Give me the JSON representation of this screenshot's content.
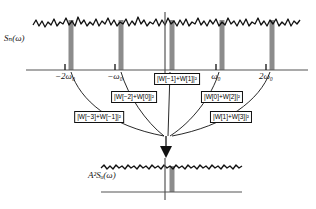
{
  "figure": {
    "width": 316,
    "height": 209,
    "colors": {
      "line": "#111111",
      "bar": "#8c8c8c",
      "axis": "#555555",
      "background": "#ffffff"
    }
  },
  "top_plot": {
    "y_axis_label": "Sₙ(ω)",
    "tick_labels": [
      {
        "text": "−2ω₀",
        "x": 65
      },
      {
        "text": "−ω₀",
        "x": 115
      },
      {
        "text": "ω₀",
        "x": 216
      },
      {
        "text": "2ω₀",
        "x": 266
      }
    ],
    "tick_positions_px": [
      65,
      115,
      165,
      216,
      266
    ],
    "bar_positions_px": [
      71,
      121,
      172,
      222,
      272
    ],
    "bar_count": 5,
    "noise_floor_description": "broadband jagged noise spectrum"
  },
  "annotations": [
    {
      "id": "w-m1-p1",
      "text": "|W[−1]+W[1]|²",
      "x": 177,
      "y": 73
    },
    {
      "id": "w-m2-p0",
      "text": "|W[−2]+W[0]|²",
      "x": 134,
      "y": 91
    },
    {
      "id": "w-p0-p2",
      "text": "|W[0]+W[2]|²",
      "x": 222,
      "y": 91
    },
    {
      "id": "w-m3-m1",
      "text": "|W[−3]+W[−1]|²",
      "x": 99,
      "y": 111
    },
    {
      "id": "w-p1-p3",
      "text": "|W[1]+W[3]|²",
      "x": 231,
      "y": 111
    }
  ],
  "bottom_plot": {
    "y_axis_label": "A²Sᵤ(ω)",
    "center_x_px": 165,
    "bar_position_px": 172,
    "arrow_label": "down-arrow",
    "noise_floor_description": "flat jagged aliased noise floor"
  }
}
